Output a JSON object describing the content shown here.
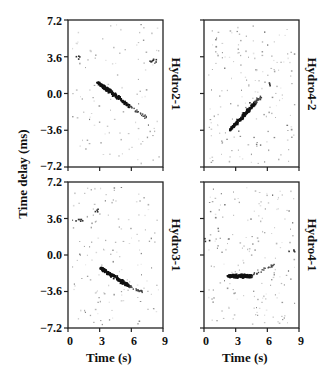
{
  "chart_data": [
    {
      "type": "scatter",
      "title": "Hydro2-1",
      "position": "top-left",
      "xlabel": "Time (s)",
      "ylabel": "Time delay (ms)",
      "xlim": [
        0,
        9
      ],
      "ylim": [
        -7.2,
        7.2
      ],
      "xticks": [
        0,
        3,
        6,
        9
      ],
      "yticks": [
        7.2,
        3.6,
        0.0,
        -3.6,
        -7.2
      ],
      "streak": {
        "start": [
          2.7,
          1.2
        ],
        "end": [
          5.8,
          -1.2
        ],
        "tail_end": [
          7.4,
          -2.3
        ],
        "width": 3.2
      },
      "clusters": [
        {
          "x": 8.0,
          "y": 3.3,
          "n": 8
        },
        {
          "x": 0.8,
          "y": 3.6,
          "n": 4
        }
      ],
      "noise_density": 110,
      "seed": 11
    },
    {
      "type": "scatter",
      "title": "Hydro4-2",
      "position": "top-right",
      "xlabel": "Time (s)",
      "ylabel": "Time delay (ms)",
      "xlim": [
        0,
        9
      ],
      "ylim": [
        -7.2,
        7.2
      ],
      "xticks": [
        0,
        3,
        6,
        9
      ],
      "yticks": [
        7.2,
        3.6,
        0.0,
        -3.6,
        -7.2
      ],
      "streak": {
        "start": [
          2.4,
          -3.5
        ],
        "end": [
          4.8,
          -0.8
        ],
        "tail_end": [
          5.3,
          -0.3
        ],
        "width": 3.0
      },
      "clusters": [
        {
          "x": 6.0,
          "y": 1.0,
          "n": 3
        },
        {
          "x": 4.6,
          "y": -1.0,
          "n": 6
        }
      ],
      "noise_density": 170,
      "seed": 23
    },
    {
      "type": "scatter",
      "title": "Hydro3-1",
      "position": "bottom-left",
      "xlabel": "Time (s)",
      "ylabel": "Time delay (ms)",
      "xlim": [
        0,
        9
      ],
      "ylim": [
        -7.2,
        7.2
      ],
      "xticks": [
        0,
        3,
        6,
        9
      ],
      "yticks": [
        7.2,
        3.6,
        0.0,
        -3.6,
        -7.2
      ],
      "streak": {
        "start": [
          3.0,
          -1.2
        ],
        "end": [
          5.7,
          -3.0
        ],
        "tail_end": [
          7.0,
          -3.6
        ],
        "width": 3.4
      },
      "clusters": [
        {
          "x": 1.0,
          "y": 3.5,
          "n": 6
        },
        {
          "x": 2.8,
          "y": 4.5,
          "n": 4
        }
      ],
      "noise_density": 140,
      "seed": 37
    },
    {
      "type": "scatter",
      "title": "Hydro4-1",
      "position": "bottom-right",
      "xlabel": "Time (s)",
      "ylabel": "Time delay (ms)",
      "xlim": [
        0,
        9
      ],
      "ylim": [
        -7.2,
        7.2
      ],
      "xticks": [
        0,
        3,
        6,
        9
      ],
      "yticks": [
        7.2,
        3.6,
        0.0,
        -3.6,
        -7.2
      ],
      "streak": {
        "start": [
          2.2,
          -2.0
        ],
        "end": [
          4.4,
          -2.0
        ],
        "tail_end": [
          6.8,
          -0.8
        ],
        "width": 3.6
      },
      "clusters": [
        {
          "x": 0.3,
          "y": 1.5,
          "n": 3
        },
        {
          "x": 8.3,
          "y": 0.5,
          "n": 4
        }
      ],
      "noise_density": 170,
      "seed": 51
    }
  ],
  "figure": {
    "ylabel": "Time delay (ms)",
    "xlabel": "Time (s)",
    "ytick_labels": [
      "7.2",
      "3.6",
      "0.0",
      "−3.6",
      "−7.2"
    ],
    "xtick_labels": [
      "0",
      "3",
      "6",
      "9"
    ],
    "panel_labels": [
      "Hydro2-1",
      "Hydro4-2",
      "Hydro3-1",
      "Hydro4-1"
    ]
  }
}
